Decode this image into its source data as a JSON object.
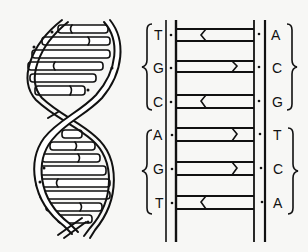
{
  "diagram": {
    "colors": {
      "ink": "#111111",
      "background": "#f7f7f5"
    },
    "helix": {
      "description": "Twisted double helix with base-pair rungs"
    },
    "ladder": {
      "left_bases": [
        "T",
        "G",
        "C",
        "A",
        "G",
        "T"
      ],
      "right_bases": [
        "A",
        "C",
        "G",
        "T",
        "C",
        "A"
      ],
      "pairs": [
        {
          "left": "T",
          "right": "A",
          "notch": "left"
        },
        {
          "left": "G",
          "right": "C",
          "notch": "right"
        },
        {
          "left": "C",
          "right": "G",
          "notch": "left"
        },
        {
          "left": "A",
          "right": "T",
          "notch": "right"
        },
        {
          "left": "G",
          "right": "C",
          "notch": "right"
        },
        {
          "left": "T",
          "right": "A",
          "notch": "left"
        }
      ],
      "left_brace_groups": [
        [
          "T",
          "G",
          "C"
        ],
        [
          "A",
          "G",
          "T"
        ]
      ],
      "right_brace_groups": [
        [
          "A",
          "C",
          "G"
        ],
        [
          "T",
          "C",
          "A"
        ]
      ]
    }
  }
}
